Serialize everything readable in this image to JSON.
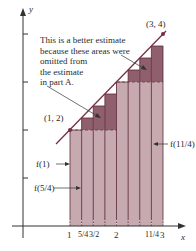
{
  "figure": {
    "annotation_lines": [
      "This is a better estimate",
      "because these areas were",
      "omitted from",
      "the estimate",
      "in part A."
    ],
    "point_start_label": "(1, 2)",
    "point_end_label": "(3, 4)",
    "axis_x_label": "x",
    "axis_y_label": "y",
    "x_ticks": [
      "1",
      "5/4",
      "3/2",
      "2",
      "11/4",
      "3"
    ],
    "callouts": {
      "f_1": "f(1)",
      "f_5_4": "f(5/4)",
      "f_11_4": "f(11/4)"
    },
    "colors": {
      "lower_rect": "#c7a9b0",
      "upper_rect": "#8f5f6d",
      "line": "#7a2e44",
      "axis": "#333333"
    }
  },
  "chart_data": {
    "type": "area",
    "title": "",
    "xlabel": "x",
    "ylabel": "y",
    "function": "f(x) = x + 1",
    "line_points": [
      [
        1,
        2
      ],
      [
        3,
        4
      ]
    ],
    "xlim": [
      0,
      3.3
    ],
    "ylim": [
      0,
      4.5
    ],
    "y_ticks": [
      1,
      2,
      3,
      4
    ],
    "partition_width": 0.25,
    "lower_rectangles": {
      "x_left": [
        1,
        1.25,
        1.5,
        1.75,
        2,
        2.25,
        2.5,
        2.75
      ],
      "height": [
        2,
        2,
        2,
        2,
        3,
        3,
        3,
        3
      ]
    },
    "left_endpoint_rectangles": {
      "x_left": [
        1,
        1.25,
        1.5,
        1.75,
        2,
        2.25,
        2.5,
        2.75
      ],
      "height": [
        2,
        2.25,
        2.5,
        2.75,
        3,
        3.25,
        3.5,
        3.75
      ]
    },
    "annotations": [
      "This is a better estimate because these areas were omitted from the estimate in part A.",
      "(1, 2)",
      "(3, 4)",
      "f(1)",
      "f(5/4)",
      "f(11/4)"
    ]
  }
}
